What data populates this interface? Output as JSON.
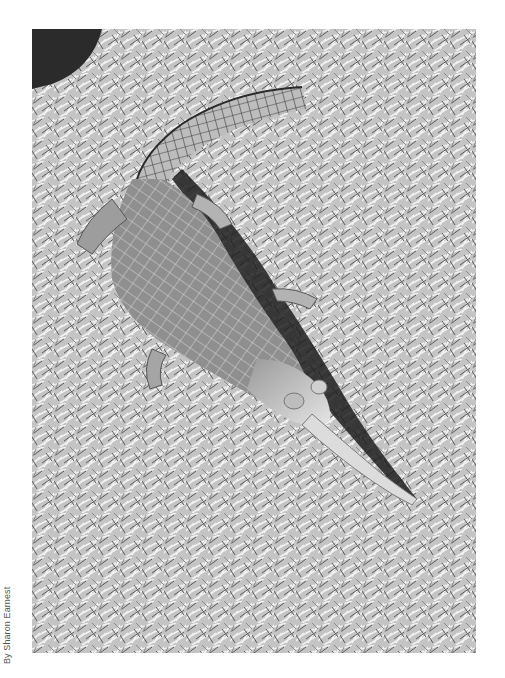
{
  "image": {
    "subject": "Gharial lying on grass",
    "style": "black-and-white photograph",
    "palette": {
      "background": "#ffffff",
      "grass_light": "#e6e6e6",
      "grass_mid": "#a8a8a8",
      "grass_dark": "#3a3a3a",
      "body": "#8e8e8e",
      "body_light": "#cfcfcf",
      "shadow": "#1e1e1e"
    }
  },
  "credit": {
    "text": "By Sharon Earnest"
  }
}
